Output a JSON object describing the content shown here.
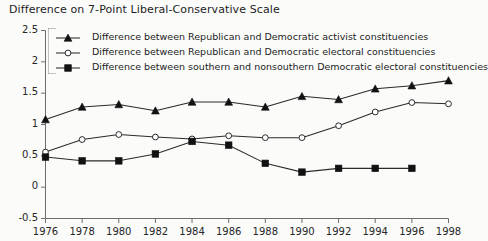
{
  "chart_data": {
    "type": "line",
    "title": "Difference on 7-Point Liberal-Conservative Scale",
    "xlabel": "",
    "ylabel": "",
    "x": [
      1976,
      1978,
      1980,
      1982,
      1984,
      1986,
      1988,
      1990,
      1992,
      1994,
      1996,
      1998
    ],
    "xtick_labels": [
      "1976",
      "1978",
      "1980",
      "1982",
      "1984",
      "1986",
      "1988",
      "1990",
      "1992",
      "1994",
      "1996",
      "1998"
    ],
    "ytick_labels": [
      "2.5",
      "2",
      "1.5",
      "1",
      "0.5",
      "0",
      "-0.5"
    ],
    "ytick_values": [
      2.5,
      2,
      1.5,
      1,
      0.5,
      0,
      -0.5
    ],
    "ylim": [
      -0.5,
      2.5
    ],
    "xlim": [
      1976,
      1998
    ],
    "grid": false,
    "legend_position": "top-left-inside",
    "series": [
      {
        "name": "Difference between Republican and Democratic activist constituencies",
        "marker": "filled-triangle",
        "values": [
          1.08,
          1.28,
          1.32,
          1.22,
          1.36,
          1.36,
          1.28,
          1.45,
          1.4,
          1.57,
          1.62,
          1.7
        ]
      },
      {
        "name": "Difference between Republican and Democratic electoral constituencies",
        "marker": "open-circle",
        "values": [
          0.56,
          0.76,
          0.84,
          0.8,
          0.77,
          0.82,
          0.79,
          0.79,
          0.98,
          1.2,
          1.35,
          1.33
        ]
      },
      {
        "name": "Difference between southern and nonsouthern Democratic electoral constituencies",
        "marker": "filled-square",
        "values": [
          0.48,
          0.42,
          0.42,
          0.53,
          0.73,
          0.67,
          0.38,
          0.24,
          0.3,
          0.3,
          0.3,
          null
        ]
      }
    ],
    "colors": {
      "line": "#2b2b2b",
      "marker_fill": "#111111",
      "open_marker_fill": "#ffffff",
      "axis": "#6e6e6e",
      "background": "#fbfbfa",
      "text": "#1d1d1d"
    }
  }
}
